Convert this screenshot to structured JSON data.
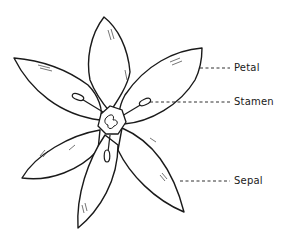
{
  "diagram": {
    "labels": [
      {
        "id": "petal",
        "text": "Petal"
      },
      {
        "id": "stamen",
        "text": "Stamen"
      },
      {
        "id": "sepal",
        "text": "Sepal"
      }
    ],
    "colors": {
      "stroke": "#1a1a1a",
      "fill": "#ffffff",
      "background": "#ffffff"
    }
  }
}
